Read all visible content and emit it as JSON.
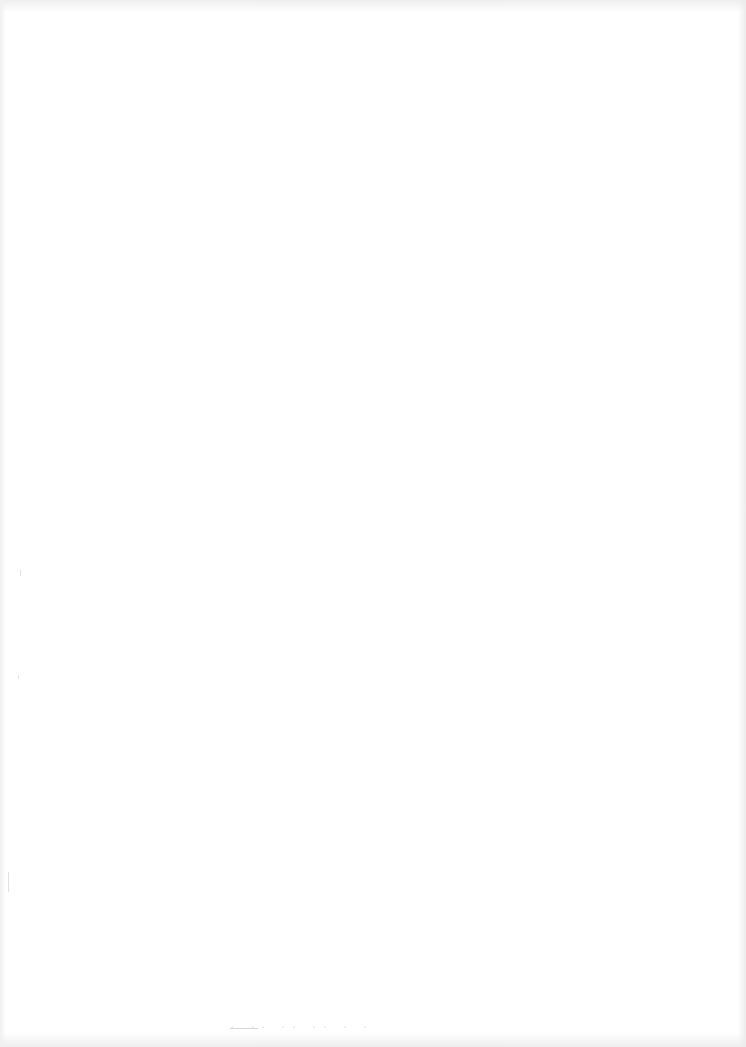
{
  "document": {
    "type": "scanned-page",
    "content": "",
    "background_color": "#ffffff",
    "edge_color": "#eeeeee",
    "bleed_through_text": "· ·· ·· ·· · ·"
  }
}
